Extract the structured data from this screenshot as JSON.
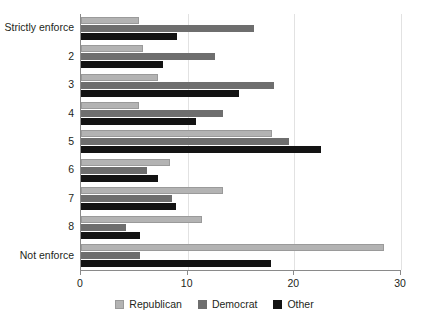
{
  "chart_data": {
    "type": "bar",
    "orientation": "horizontal",
    "title": "",
    "subtitle": "",
    "xlabel": "",
    "ylabel": "",
    "xlim": [
      0,
      30
    ],
    "xticks": [
      0,
      10,
      20,
      30
    ],
    "xtick_labels": [
      "0",
      "10",
      "20",
      "30"
    ],
    "grid": "vertical",
    "legend_position": "bottom-center",
    "categories": [
      "Strictly enforce",
      "2",
      "3",
      "4",
      "5",
      "6",
      "7",
      "8",
      "Not enforce"
    ],
    "series": [
      {
        "name": "Republican",
        "color": "#b3b3b3",
        "values": [
          5.4,
          5.8,
          7.2,
          5.4,
          17.9,
          8.3,
          13.3,
          11.3,
          28.4
        ]
      },
      {
        "name": "Democrat",
        "color": "#6e6e6e",
        "values": [
          16.2,
          12.6,
          18.1,
          13.3,
          19.5,
          6.2,
          8.5,
          4.2,
          5.5
        ]
      },
      {
        "name": "Other",
        "color": "#131313",
        "values": [
          9.0,
          7.7,
          14.8,
          10.8,
          22.5,
          7.2,
          8.9,
          5.5,
          17.8
        ]
      }
    ]
  },
  "legend": {
    "items": [
      {
        "label": "Republican",
        "key": "republican"
      },
      {
        "label": "Democrat",
        "key": "democrat"
      },
      {
        "label": "Other",
        "key": "other"
      }
    ]
  },
  "colors": {
    "republican": "#b3b3b3",
    "democrat": "#6e6e6e",
    "other": "#131313",
    "axis": "#8a8a8a",
    "grid": "#e2e2e2",
    "text": "#231f20",
    "background": "#ffffff"
  }
}
